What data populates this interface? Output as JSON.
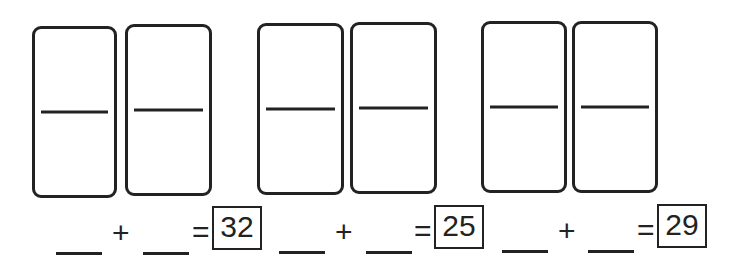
{
  "worksheet": {
    "problems": [
      {
        "dominoes": [
          {
            "top": "",
            "bottom": ""
          },
          {
            "top": "",
            "bottom": ""
          }
        ],
        "addend1": "",
        "addend2": "",
        "plus": "+",
        "equals": "=",
        "sum": "32"
      },
      {
        "dominoes": [
          {
            "top": "",
            "bottom": ""
          },
          {
            "top": "",
            "bottom": ""
          }
        ],
        "addend1": "",
        "addend2": "",
        "plus": "+",
        "equals": "=",
        "sum": "25"
      },
      {
        "dominoes": [
          {
            "top": "",
            "bottom": ""
          },
          {
            "top": "",
            "bottom": ""
          }
        ],
        "addend1": "",
        "addend2": "",
        "plus": "+",
        "equals": "=",
        "sum": "29"
      }
    ]
  }
}
